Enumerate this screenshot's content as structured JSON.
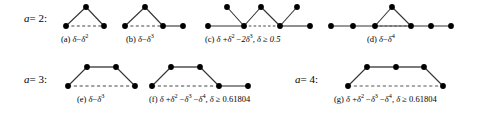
{
  "figure": {
    "rows": [
      {
        "label_var": "a",
        "label_eq": "= 2:"
      },
      {
        "label_var": "a",
        "label_eq": "= 3:"
      },
      {
        "label_var": "a",
        "label_eq": "= 4:"
      }
    ],
    "items": [
      {
        "id": "a",
        "tag": "(a)",
        "formula_parts": [
          "δ",
          " − ",
          "δ",
          "2"
        ],
        "formula_plain": "(a)  δ − δ²",
        "node_count": 3,
        "solid_edges": 2,
        "dashed_edges": 1
      },
      {
        "id": "b",
        "tag": "(b)",
        "formula_parts": [
          "δ",
          " − ",
          "δ",
          "3"
        ],
        "formula_plain": "(b)  δ − δ³",
        "node_count": 4,
        "solid_edges": 3,
        "dashed_edges": 1
      },
      {
        "id": "c",
        "tag": "(c)",
        "formula_plain": "(c)  δ + δ² − 2δ³, δ ≥ 0.5",
        "condition": "δ ≥ 0.5",
        "node_count": 8,
        "solid_edges": 8,
        "dashed_edges": 1
      },
      {
        "id": "d",
        "tag": "(d)",
        "formula_parts": [
          "δ",
          " − ",
          "δ",
          "4"
        ],
        "formula_plain": "(d)  δ − δ⁴",
        "node_count": 6,
        "solid_edges": 6,
        "dashed_edges": 1
      },
      {
        "id": "e",
        "tag": "(e)",
        "formula_parts": [
          "δ",
          " − ",
          "δ",
          "3"
        ],
        "formula_plain": "(e)  δ − δ³",
        "node_count": 4,
        "solid_edges": 3,
        "dashed_edges": 1
      },
      {
        "id": "f",
        "tag": "(f)",
        "formula_plain": "(f)  δ + δ² − δ³ − δ⁴, δ ≥",
        "condition": "δ ≥",
        "condition_value": "0.61804",
        "node_count": 5,
        "solid_edges": 4,
        "dashed_edges": 1
      },
      {
        "id": "g",
        "tag": "(g)",
        "formula_plain": "(g)  δ + δ² − δ³ − δ⁴, δ ≥",
        "condition": "δ ≥",
        "condition_value": "0.61804",
        "node_count": 5,
        "solid_edges": 4,
        "dashed_edges": 1
      }
    ],
    "symbols": {
      "delta": "δ",
      "minus": "−",
      "plus": "+",
      "geq": "≥",
      "comma": ","
    },
    "colors": {
      "node": "#000000",
      "edge": "#333333",
      "dashed": "#555555",
      "background": "#ffffff",
      "text": "#000000"
    },
    "captions": {
      "a": {
        "tag": "(a)",
        "base": "δ",
        "op": "−",
        "term": "δ",
        "exp": "2"
      },
      "b": {
        "tag": "(b)",
        "base": "δ",
        "op": "−",
        "term": "δ",
        "exp": "3"
      },
      "c": {
        "tag": "(c)",
        "t1": "δ",
        "o1": "+",
        "t2": "δ",
        "e2": "2",
        "o2": "−",
        "t3": "2δ",
        "e3": "3",
        "cond": ", δ ≥ 0.5"
      },
      "d": {
        "tag": "(d)",
        "base": "δ",
        "op": "−",
        "term": "δ",
        "exp": "4"
      },
      "e": {
        "tag": "(e)",
        "base": "δ",
        "op": "−",
        "term": "δ",
        "exp": "3"
      },
      "f": {
        "tag": "(f)",
        "t1": "δ",
        "o1": "+",
        "t2": "δ",
        "e2": "2",
        "o2": "−",
        "t3": "δ",
        "e3": "3",
        "o3": "−",
        "t4": "δ",
        "e4": "4",
        "cond": ", δ ≥",
        "cond2": "0.61804"
      },
      "g": {
        "tag": "(g)",
        "t1": "δ",
        "o1": "+",
        "t2": "δ",
        "e2": "2",
        "o2": "−",
        "t3": "δ",
        "e3": "3",
        "o3": "−",
        "t4": "δ",
        "e4": "4",
        "cond": ", δ ≥",
        "cond2": "0.61804"
      }
    }
  }
}
